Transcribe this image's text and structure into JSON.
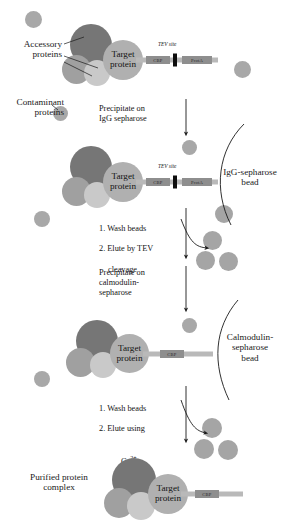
{
  "diagram": {
    "colors": {
      "accessory_dark": "#767676",
      "accessory_mid": "#a0a0a0",
      "accessory_light": "#c9c9c9",
      "target": "#b0b0b0",
      "contaminant": "#a8a8a8",
      "bead": "#a5a5a5",
      "tag_stem": "#b9b9b9",
      "tag_box": "#8e8e8e",
      "tev_mark": "#0d0d0d",
      "line": "#1a1a1a",
      "background": "#ffffff"
    }
  },
  "labels": {
    "accessory_proteins": "Accessory\nproteins",
    "contaminant_proteins": "Contaminant\nproteins",
    "igg_bead": "IgG-sepharose\nbead",
    "calmodulin_bead": "Calmodulin-\nsepharose\nbead",
    "purified_complex": "Purified protein\ncomplex",
    "target_protein": "Target\nprotein"
  },
  "tags": {
    "cbp": "CBP",
    "prota": "ProtA",
    "tev_site": "TEV site"
  },
  "steps": {
    "step1": "Precipitate on\nIgG sepharose",
    "step2_line1": "1. Wash beads",
    "step2_line2": "2. Elute by TEV",
    "step2_line3": "cleavage",
    "step3": "Precipitate on\ncalmodulin-\nsepharose",
    "step4_line1": "1. Wash beads",
    "step4_line2": "2. Elute using",
    "step4_line3_base": "Ca",
    "step4_line3_sup": "2+"
  },
  "stages": [
    {
      "id": "stage-1-crude-extract",
      "name": "Crude extract with tagged target protein",
      "has_prota": true,
      "has_cbp": true,
      "has_tev": true,
      "on_bead": false
    },
    {
      "id": "stage-2-igg-bound",
      "name": "Complex bound to IgG-sepharose bead",
      "has_prota": true,
      "has_cbp": true,
      "has_tev": true,
      "on_bead": true,
      "bead_type": "IgG-sepharose"
    },
    {
      "id": "stage-3-calmodulin-bound",
      "name": "Complex bound to calmodulin-sepharose bead",
      "has_prota": false,
      "has_cbp": true,
      "has_tev": false,
      "on_bead": true,
      "bead_type": "Calmodulin-sepharose"
    },
    {
      "id": "stage-4-purified",
      "name": "Purified protein complex",
      "has_prota": false,
      "has_cbp": true,
      "has_tev": false,
      "on_bead": false
    }
  ]
}
